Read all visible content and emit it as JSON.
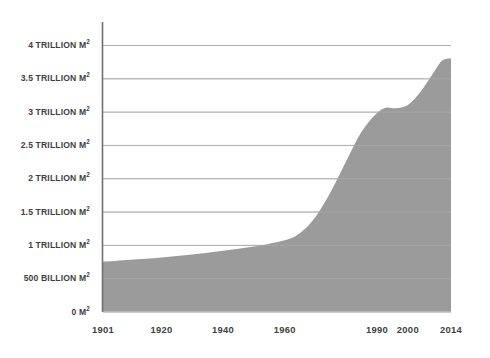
{
  "chart_data": {
    "type": "area",
    "title": "",
    "subtitle": "",
    "xlabel": "",
    "ylabel": "",
    "grid": true,
    "legend_position": "none",
    "xlim": [
      1901,
      2014
    ],
    "ylim": [
      0,
      4000
    ],
    "y_unit": "billion M²",
    "y_tick_values": [
      0,
      500,
      1000,
      1500,
      2000,
      2500,
      3000,
      3500,
      4000
    ],
    "y_tick_labels": [
      "0 M²",
      "500 BILLION M²",
      "1 TRILLION M²",
      "1.5 TRILLION M²",
      "2 TRILLION M²",
      "2.5 TRILLION M²",
      "3 TRILLION M²",
      "3.5 TRILLION M²",
      "4 TRILLION M²"
    ],
    "x_tick_labels": [
      "1901",
      "1920",
      "1940",
      "1960",
      "1990",
      "2000",
      "2014"
    ],
    "x_tick_positions": [
      1901,
      1920,
      1940,
      1960,
      1990,
      2000,
      2014
    ],
    "series": [
      {
        "name": "Cumulative area",
        "fill_color": "#9b9b9b",
        "x": [
          1901,
          1910,
          1920,
          1930,
          1940,
          1950,
          1960,
          1965,
          1970,
          1975,
          1980,
          1985,
          1990,
          1993,
          1996,
          2000,
          2004,
          2008,
          2011,
          2014
        ],
        "values": [
          745,
          775,
          810,
          855,
          910,
          975,
          1070,
          1180,
          1420,
          1800,
          2260,
          2700,
          2980,
          3060,
          3050,
          3100,
          3290,
          3560,
          3760,
          3800
        ]
      }
    ],
    "colors": {
      "fill": "#9b9b9b",
      "gridline": "#b0b0b0",
      "axis": "#6e7074",
      "text": "#3d3f42",
      "background": "#ffffff"
    }
  },
  "y_axis_labels": [
    {
      "text": "4 TRILLION M",
      "sup": "2",
      "value": 4000
    },
    {
      "text": "3.5 TRILLION M",
      "sup": "2",
      "value": 3500
    },
    {
      "text": "3 TRILLION M",
      "sup": "2",
      "value": 3000
    },
    {
      "text": "2.5 TRILLION M",
      "sup": "2",
      "value": 2500
    },
    {
      "text": "2 TRILLION M",
      "sup": "2",
      "value": 2000
    },
    {
      "text": "1.5 TRILLION M",
      "sup": "2",
      "value": 1500
    },
    {
      "text": "1 TRILLION M",
      "sup": "2",
      "value": 1000
    },
    {
      "text": "500 BILLION M",
      "sup": "2",
      "value": 500
    },
    {
      "text": "0 M",
      "sup": "2",
      "value": 0
    }
  ],
  "x_axis_labels": [
    {
      "text": "1901",
      "value": 1901
    },
    {
      "text": "1920",
      "value": 1920
    },
    {
      "text": "1940",
      "value": 1940
    },
    {
      "text": "1960",
      "value": 1960
    },
    {
      "text": "1990",
      "value": 1990
    },
    {
      "text": "2000",
      "value": 2000
    },
    {
      "text": "2014",
      "value": 2014
    }
  ]
}
